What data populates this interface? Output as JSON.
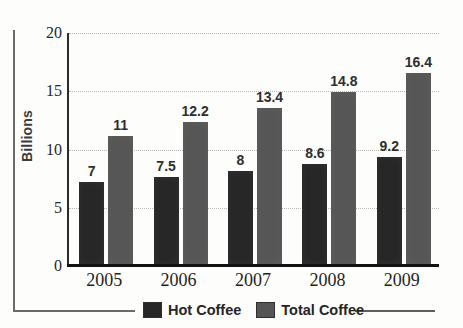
{
  "chart_data": {
    "type": "bar",
    "title": "",
    "xlabel": "",
    "ylabel": "Billions",
    "ylim": [
      0,
      20
    ],
    "yticks": [
      0,
      5,
      10,
      15,
      20
    ],
    "ytick_labels": [
      "0",
      "5",
      "10",
      "15",
      "20"
    ],
    "grid": true,
    "legend_position": "bottom",
    "categories": [
      "2005",
      "2006",
      "2007",
      "2008",
      "2009"
    ],
    "series": [
      {
        "name": "Hot Coffee",
        "color": "#272727",
        "values": [
          7,
          7.5,
          8,
          8.6,
          9.2
        ],
        "value_labels": [
          "7",
          "7.5",
          "8",
          "8.6",
          "9.2"
        ]
      },
      {
        "name": "Total Coffee",
        "color": "#565656",
        "values": [
          11,
          12.2,
          13.4,
          14.8,
          16.4
        ],
        "value_labels": [
          "11",
          "12.2",
          "13.4",
          "14.8",
          "16.4"
        ]
      }
    ]
  },
  "axis": {
    "y_title": "Billions"
  },
  "legend": {
    "items": [
      {
        "label": "Hot Coffee",
        "swatch": "hot"
      },
      {
        "label": "Total Coffee",
        "swatch": "total"
      }
    ]
  }
}
